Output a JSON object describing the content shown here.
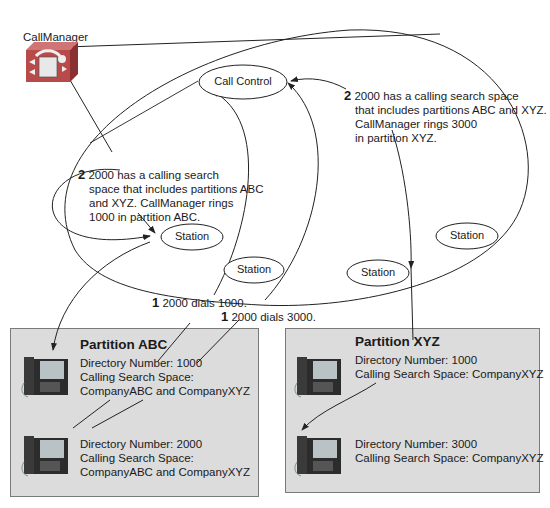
{
  "callmanager": {
    "label": "CallManager",
    "icon": "callmanager-server-icon"
  },
  "nodes": {
    "call_control": "Call Control",
    "stations": [
      "Station",
      "Station",
      "Station",
      "Station"
    ]
  },
  "annotations": {
    "step2_left": {
      "num": "2",
      "lines": [
        "2000 has a calling search",
        "space that includes partitions ABC",
        "and XYZ. CallManager rings",
        "1000 in partition ABC."
      ]
    },
    "step2_right": {
      "num": "2",
      "lines": [
        "2000 has a calling search space",
        "that includes partitions ABC and XYZ.",
        "CallManager rings 3000",
        "in partition XYZ."
      ]
    },
    "step1_a": {
      "num": "1",
      "text": "2000 dials 1000."
    },
    "step1_b": {
      "num": "1",
      "text": "2000 dials 3000."
    }
  },
  "partitions": [
    {
      "title": "Partition ABC",
      "phones": [
        {
          "lines": [
            "Directory Number: 1000",
            "Calling Search Space:",
            "CompanyABC and CompanyXYZ"
          ]
        },
        {
          "lines": [
            "Directory Number: 2000",
            "Calling Search Space:",
            "CompanyABC and CompanyXYZ"
          ]
        }
      ]
    },
    {
      "title": "Partition XYZ",
      "phones": [
        {
          "lines": [
            "Directory Number: 1000",
            "Calling Search Space: CompanyXYZ"
          ]
        },
        {
          "lines": [
            "Directory Number: 3000",
            "Calling Search Space: CompanyXYZ"
          ]
        }
      ]
    }
  ],
  "colors": {
    "partition_bg": "#dcdcdc",
    "server_red": "#b84a4a",
    "line": "#222222"
  }
}
